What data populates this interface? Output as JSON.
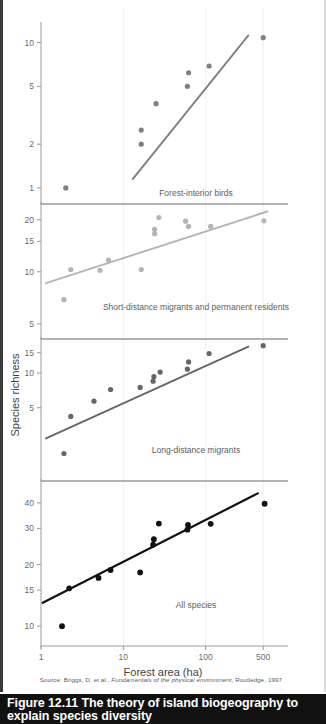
{
  "figure": {
    "caption_number": "Figure 12.11",
    "caption_title": "The theory of island biogeography to explain species diversity",
    "source_prefix": "Source: Briggs, D. et al.,",
    "source_italic": "Fundamentals of the physical environment",
    "source_suffix": ", Routledge, 1997"
  },
  "chart_data": {
    "type": "scatter",
    "title": "The theory of island biogeography to explain species diversity",
    "xlabel": "Forest area (ha)",
    "ylabel": "Species richness",
    "xscale": "log",
    "yscale": "log",
    "xlim": [
      1,
      1000
    ],
    "xticks": [
      1,
      10,
      100,
      500
    ],
    "xticklabels": [
      "1",
      "10",
      "100",
      "500"
    ],
    "grid": true,
    "legend": "panel-annotations",
    "panels": [
      {
        "name": "forest-interior-birds",
        "label": "Forest-interior birds",
        "color": "#808080",
        "yticks": [
          10,
          5,
          2,
          1
        ],
        "yticklabels": [
          "10",
          "5",
          "2",
          "1"
        ],
        "ylim": [
          0.8,
          13
        ],
        "points": [
          {
            "x": 2.0,
            "y": 1.0
          },
          {
            "x": 16.5,
            "y": 2.0
          },
          {
            "x": 16.5,
            "y": 2.5
          },
          {
            "x": 25.0,
            "y": 3.8
          },
          {
            "x": 60.0,
            "y": 5.0
          },
          {
            "x": 62.0,
            "y": 6.2
          },
          {
            "x": 110.0,
            "y": 6.9
          },
          {
            "x": 500.0,
            "y": 10.8
          }
        ],
        "fit_line": {
          "x1": 13.0,
          "y1": 1.15,
          "x2": 330.0,
          "y2": 11.2
        }
      },
      {
        "name": "short-distance-migrants-permanent-residents",
        "label": "Short-distance migrants and permanent residents",
        "color": "#b4b4b4",
        "yticks": [
          20,
          15,
          10,
          5
        ],
        "yticklabels": [
          "20",
          "15",
          "10",
          "5"
        ],
        "ylim": [
          4.2,
          24
        ],
        "points": [
          {
            "x": 1.9,
            "y": 6.9
          },
          {
            "x": 2.3,
            "y": 10.3
          },
          {
            "x": 5.2,
            "y": 10.2
          },
          {
            "x": 6.6,
            "y": 11.7
          },
          {
            "x": 16.5,
            "y": 10.3
          },
          {
            "x": 24.0,
            "y": 16.6
          },
          {
            "x": 24.0,
            "y": 17.6
          },
          {
            "x": 27.0,
            "y": 20.6
          },
          {
            "x": 57.0,
            "y": 19.6
          },
          {
            "x": 62.0,
            "y": 18.3
          },
          {
            "x": 115.0,
            "y": 18.3
          },
          {
            "x": 510.0,
            "y": 19.7
          }
        ],
        "fit_line": {
          "x1": 1.15,
          "y1": 8.6,
          "x2": 560.0,
          "y2": 22.3
        }
      },
      {
        "name": "long-distance-migrants",
        "label": "Long-distance migrants",
        "color": "#666666",
        "yticks": [
          15,
          10,
          5
        ],
        "yticklabels": [
          "15",
          "10",
          "5"
        ],
        "ylim": [
          1.2,
          19
        ],
        "points": [
          {
            "x": 1.9,
            "y": 2.0
          },
          {
            "x": 2.3,
            "y": 4.2
          },
          {
            "x": 4.4,
            "y": 5.7
          },
          {
            "x": 7.0,
            "y": 7.2
          },
          {
            "x": 16.0,
            "y": 7.5
          },
          {
            "x": 23.0,
            "y": 8.5
          },
          {
            "x": 23.5,
            "y": 9.3
          },
          {
            "x": 28.0,
            "y": 10.2
          },
          {
            "x": 60.0,
            "y": 10.8
          },
          {
            "x": 62.0,
            "y": 12.5
          },
          {
            "x": 110.0,
            "y": 14.8
          },
          {
            "x": 500.0,
            "y": 17.3
          }
        ],
        "fit_line": {
          "x1": 1.15,
          "y1": 2.7,
          "x2": 330.0,
          "y2": 17.0
        }
      },
      {
        "name": "all-species",
        "label": "All species",
        "color": "#111111",
        "yticks": [
          40,
          30,
          20,
          15,
          10
        ],
        "yticklabels": [
          "40",
          "30",
          "20",
          "15",
          "10"
        ],
        "ylim": [
          8,
          50
        ],
        "points": [
          {
            "x": 1.8,
            "y": 10.0
          },
          {
            "x": 2.2,
            "y": 15.3
          },
          {
            "x": 5.0,
            "y": 17.2
          },
          {
            "x": 7.0,
            "y": 18.8
          },
          {
            "x": 16.0,
            "y": 18.3
          },
          {
            "x": 23.0,
            "y": 25.0
          },
          {
            "x": 23.5,
            "y": 26.6
          },
          {
            "x": 27.0,
            "y": 31.7
          },
          {
            "x": 60.0,
            "y": 29.6
          },
          {
            "x": 61.0,
            "y": 31.2
          },
          {
            "x": 115.0,
            "y": 31.6
          },
          {
            "x": 520.0,
            "y": 39.6
          }
        ],
        "fit_line": {
          "x1": 1.05,
          "y1": 13.0,
          "x2": 430.0,
          "y2": 44.5
        }
      }
    ]
  }
}
